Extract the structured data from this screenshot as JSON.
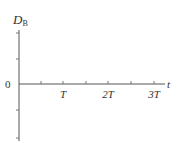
{
  "diagram": {
    "y_axis": {
      "label_main": "D",
      "label_sub": "B",
      "origin_label": "0",
      "ticks_y": [
        33,
        59,
        110,
        138
      ]
    },
    "x_axis": {
      "label": "t",
      "tick_labels": [
        {
          "text": "T",
          "x": 63
        },
        {
          "text": "2T",
          "x": 108
        },
        {
          "text": "3T",
          "x": 154
        }
      ],
      "ticks_x": [
        41,
        63,
        86,
        108,
        131,
        154
      ]
    },
    "colors": {
      "axis": "#555555",
      "text": "#333333",
      "background": "#ffffff"
    }
  }
}
